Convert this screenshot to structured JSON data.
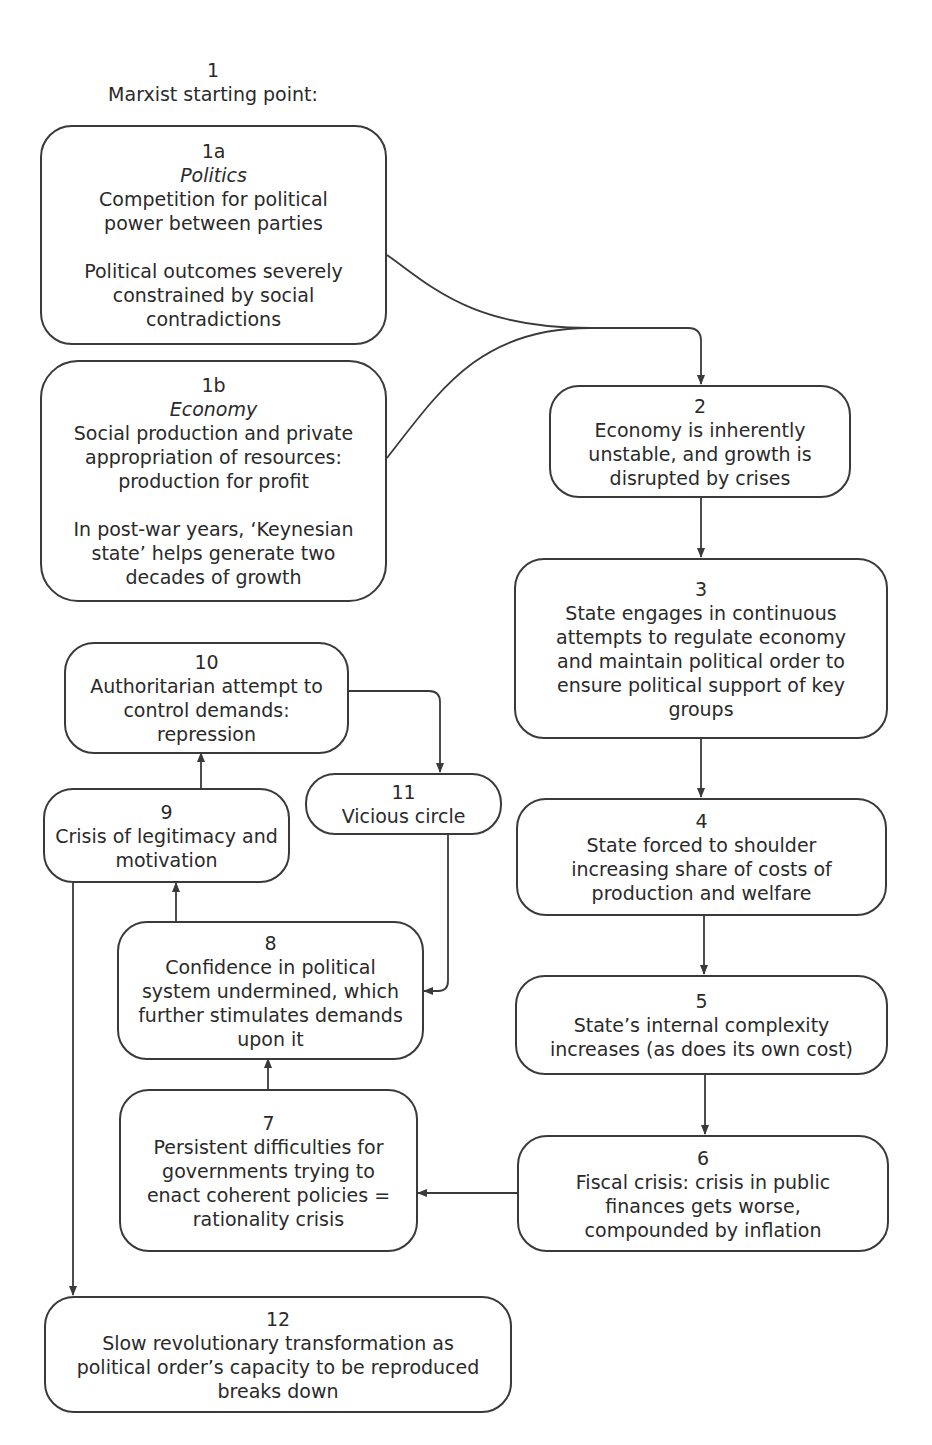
{
  "header": {
    "number": "1",
    "title": "Marxist starting point:"
  },
  "nodes": {
    "n1a": {
      "number": "1a",
      "category": "Politics",
      "text": "Competition for political\npower between parties",
      "text2": "Political outcomes severely\nconstrained by social\ncontradictions"
    },
    "n1b": {
      "number": "1b",
      "category": "Economy",
      "text": "Social production and private\nappropriation of resources:\nproduction for profit",
      "text2": "In post-war years, ‘Keynesian\nstate’ helps generate two\ndecades of growth"
    },
    "n2": {
      "number": "2",
      "text": "Economy is inherently\nunstable, and growth is\ndisrupted by crises"
    },
    "n3": {
      "number": "3",
      "text": "State engages in continuous\nattempts to regulate economy\nand maintain political order to\nensure political support of key\ngroups"
    },
    "n4": {
      "number": "4",
      "text": "State forced to shoulder\nincreasing share of costs of\nproduction and welfare"
    },
    "n5": {
      "number": "5",
      "text": "State’s internal complexity\nincreases (as does its own cost)"
    },
    "n6": {
      "number": "6",
      "text": "Fiscal crisis: crisis in public\nfinances gets worse,\ncompounded by inflation"
    },
    "n7": {
      "number": "7",
      "text": "Persistent difficulties for\ngovernments trying to\nenact coherent policies =\nrationality crisis"
    },
    "n8": {
      "number": "8",
      "text": "Confidence in political\nsystem undermined, which\nfurther stimulates demands\nupon it"
    },
    "n9": {
      "number": "9",
      "text": "Crisis of legitimacy and\nmotivation"
    },
    "n10": {
      "number": "10",
      "text": "Authoritarian attempt to\ncontrol demands:\nrepression"
    },
    "n11": {
      "number": "11",
      "text": "Vicious circle"
    },
    "n12": {
      "number": "12",
      "text": "Slow revolutionary transformation as\npolitical order’s capacity to be reproduced\nbreaks down"
    }
  },
  "edges": [
    {
      "from": "1a",
      "to": "2"
    },
    {
      "from": "1b",
      "to": "2"
    },
    {
      "from": "2",
      "to": "3"
    },
    {
      "from": "3",
      "to": "4"
    },
    {
      "from": "4",
      "to": "5"
    },
    {
      "from": "5",
      "to": "6"
    },
    {
      "from": "6",
      "to": "7"
    },
    {
      "from": "7",
      "to": "8"
    },
    {
      "from": "8",
      "to": "9"
    },
    {
      "from": "9",
      "to": "10"
    },
    {
      "from": "10",
      "to": "11"
    },
    {
      "from": "11",
      "to": "8"
    },
    {
      "from": "9",
      "to": "12"
    }
  ],
  "colors": {
    "line": "#3a3a3a",
    "text": "#2a2a2a",
    "background": "#ffffff"
  }
}
